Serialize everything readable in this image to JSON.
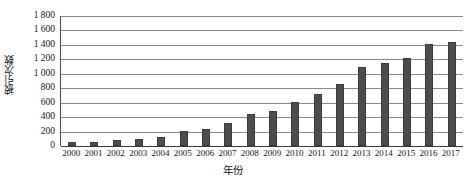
{
  "chart_data": {
    "type": "bar",
    "title": "",
    "xlabel": "年份",
    "ylabel": "被引次数",
    "categories": [
      "2000",
      "2001",
      "2002",
      "2003",
      "2004",
      "2005",
      "2006",
      "2007",
      "2008",
      "2009",
      "2010",
      "2011",
      "2012",
      "2013",
      "2014",
      "2015",
      "2016",
      "2017"
    ],
    "values": [
      60,
      55,
      85,
      95,
      130,
      205,
      230,
      325,
      450,
      485,
      615,
      725,
      855,
      1090,
      1155,
      1220,
      1415,
      1435
    ],
    "ylim": [
      0,
      1800
    ],
    "ytick_values": [
      0,
      200,
      400,
      600,
      800,
      1000,
      1200,
      1400,
      1600,
      1800
    ],
    "ytick_labels": [
      "0",
      "200",
      "400",
      "600",
      "800",
      "1 000",
      "1 200",
      "1 400",
      "1 600",
      "1 800"
    ],
    "grid": true,
    "grid_axis": "y",
    "legend": null,
    "legend_position": "none",
    "bar_color": "#4d4d4d",
    "grid_color": "#8a8a8a",
    "axis_color": "#3a3a3a"
  }
}
